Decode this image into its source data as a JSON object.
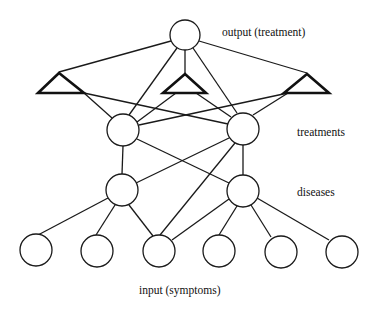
{
  "diagram": {
    "type": "neural-network",
    "labels": {
      "output": "output (treatment)",
      "treatments": "treatments",
      "diseases": "diseases",
      "input": "input (symptoms)"
    },
    "layers": [
      {
        "name": "output",
        "label": "output (treatment)",
        "node_count": 1,
        "shape": "circle"
      },
      {
        "name": "gating",
        "label": "",
        "node_count": 3,
        "shape": "triangle"
      },
      {
        "name": "treatments",
        "label": "treatments",
        "node_count": 2,
        "shape": "circle"
      },
      {
        "name": "diseases",
        "label": "diseases",
        "node_count": 2,
        "shape": "circle"
      },
      {
        "name": "input",
        "label": "input (symptoms)",
        "node_count": 6,
        "shape": "circle"
      }
    ],
    "colors": {
      "stroke": "#1a1a1a",
      "background": "#ffffff"
    }
  }
}
